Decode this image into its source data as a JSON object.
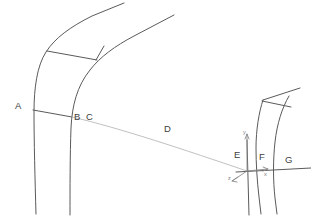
{
  "figure": {
    "type": "line-drawing",
    "background_color": "#ffffff",
    "line_color": "#5a5a5a",
    "faint_line_color": "#b9b9b9",
    "axis_line_color": "#8a8a8a",
    "label_color": "#3d3d3d"
  },
  "labels": [
    {
      "id": "A",
      "text": "A",
      "x": 15,
      "y": 101
    },
    {
      "id": "B",
      "text": "B",
      "x": 74,
      "y": 112
    },
    {
      "id": "C",
      "text": "C",
      "x": 86,
      "y": 112
    },
    {
      "id": "D",
      "text": "D",
      "x": 164,
      "y": 124
    },
    {
      "id": "E",
      "text": "E",
      "x": 234,
      "y": 150
    },
    {
      "id": "F",
      "text": "F",
      "x": 259,
      "y": 152
    },
    {
      "id": "G",
      "text": "G",
      "x": 285,
      "y": 155
    }
  ],
  "axis_labels": [
    {
      "id": "y",
      "text": "y",
      "x": 243,
      "y": 130
    },
    {
      "id": "z",
      "text": "z",
      "x": 228,
      "y": 176
    },
    {
      "id": "x",
      "text": "x",
      "x": 264,
      "y": 172
    }
  ],
  "axes": {
    "origin_x": 247,
    "origin_y": 172,
    "y_tip_x": 247,
    "y_tip_y": 133,
    "z_tip_x": 231,
    "z_tip_y": 181,
    "x_tip_x": 266,
    "x_tip_y": 169
  }
}
